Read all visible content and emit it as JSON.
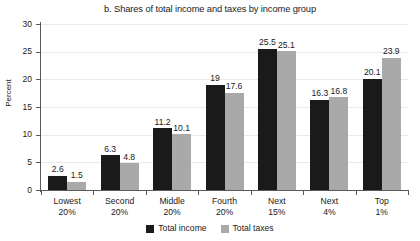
{
  "chart_data": {
    "type": "bar",
    "title": "b. Shares of total income and taxes by income group",
    "xlabel": "",
    "ylabel": "Percent",
    "ylim": [
      0,
      30
    ],
    "ytick_step": 5,
    "yticks": [
      "0",
      "5",
      "10",
      "15",
      "20",
      "25",
      "30"
    ],
    "grid": true,
    "legend_position": "bottom-center",
    "categories": [
      "Lowest\n20%",
      "Second\n20%",
      "Middle\n20%",
      "Fourth\n20%",
      "Next\n15%",
      "Next\n4%",
      "Top\n1%"
    ],
    "category_lines": [
      [
        "Lowest",
        "20%"
      ],
      [
        "Second",
        "20%"
      ],
      [
        "Middle",
        "20%"
      ],
      [
        "Fourth",
        "20%"
      ],
      [
        "Next",
        "15%"
      ],
      [
        "Next",
        "4%"
      ],
      [
        "Top",
        "1%"
      ]
    ],
    "series": [
      {
        "name": "Total income",
        "color": "#1a1a1a",
        "values": [
          2.6,
          6.3,
          11.2,
          19.0,
          25.5,
          16.3,
          20.1
        ],
        "labels": [
          "2.6",
          "6.3",
          "11.2",
          "19",
          "25.5",
          "16.3",
          "20.1"
        ]
      },
      {
        "name": "Total taxes",
        "color": "#a9a9a9",
        "values": [
          1.5,
          4.8,
          10.1,
          17.6,
          25.1,
          16.8,
          23.9
        ],
        "labels": [
          "1.5",
          "4.8",
          "10.1",
          "17.6",
          "25.1",
          "16.8",
          "23.9"
        ]
      }
    ]
  },
  "colors": {
    "income": "#1a1a1a",
    "taxes": "#a9a9a9",
    "axis": "#5a5a5a",
    "grid": "#e9e9e9",
    "background": "#ffffff"
  }
}
